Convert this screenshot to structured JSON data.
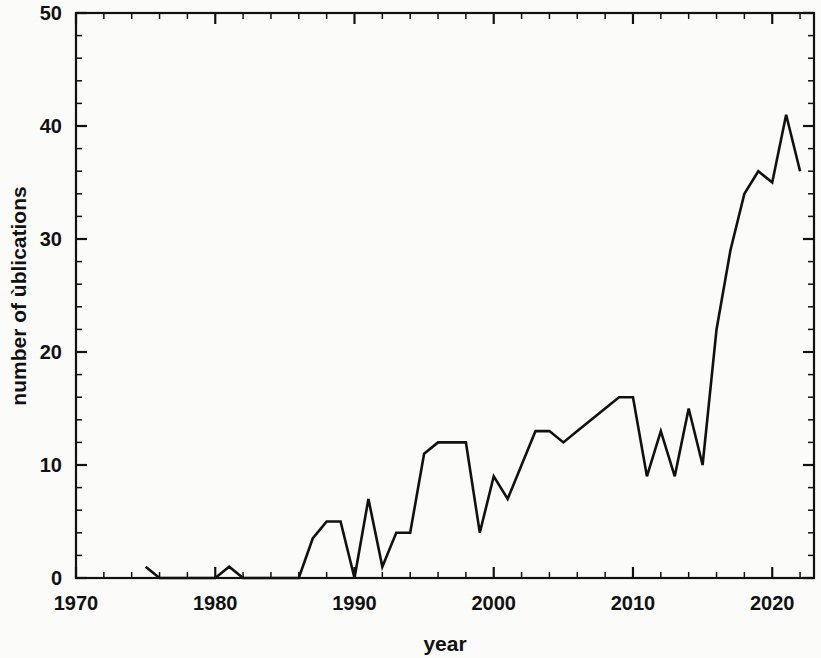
{
  "chart_data": {
    "type": "line",
    "title": "",
    "xlabel": "year",
    "ylabel": "number of ùblications",
    "xlim": [
      1970,
      2023
    ],
    "ylim": [
      0,
      50
    ],
    "xticks": [
      1970,
      1980,
      1990,
      2000,
      2010,
      2020
    ],
    "xtick_labels": [
      "1970",
      "1980",
      "1990",
      "2000",
      "2010",
      "2020"
    ],
    "yticks": [
      0,
      10,
      20,
      30,
      40,
      50
    ],
    "ytick_labels": [
      "0",
      "10",
      "20",
      "30",
      "40",
      "50"
    ],
    "x_minor_tick_interval": 2,
    "y_minor_tick_interval": 2,
    "grid": false,
    "legend": false,
    "line_color": "#111111",
    "background_color": "#fbfbfa",
    "x": [
      1975,
      1976,
      1977,
      1978,
      1979,
      1980,
      1981,
      1982,
      1983,
      1984,
      1985,
      1986,
      1987,
      1988,
      1989,
      1990,
      1991,
      1992,
      1993,
      1994,
      1995,
      1996,
      1997,
      1998,
      1999,
      2000,
      2001,
      2002,
      2003,
      2004,
      2005,
      2006,
      2007,
      2008,
      2009,
      2010,
      2011,
      2012,
      2013,
      2014,
      2015,
      2016,
      2017,
      2018,
      2019,
      2020,
      2021,
      2022
    ],
    "values": [
      1,
      0,
      0,
      0,
      0,
      0,
      1,
      0,
      0,
      0,
      0,
      0,
      3.5,
      5,
      5,
      0,
      7,
      1,
      4,
      4,
      11,
      12,
      12,
      12,
      4,
      9,
      7,
      10,
      13,
      13,
      12,
      13,
      14,
      15,
      16,
      16,
      9,
      13,
      9,
      15,
      10,
      22,
      29,
      34,
      36,
      35,
      41,
      36
    ],
    "series": [
      {
        "name": "number of publications",
        "values": [
          1,
          0,
          0,
          0,
          0,
          0,
          1,
          0,
          0,
          0,
          0,
          0,
          3.5,
          5,
          5,
          0,
          7,
          1,
          4,
          4,
          11,
          12,
          12,
          12,
          4,
          9,
          7,
          10,
          13,
          13,
          12,
          13,
          14,
          15,
          16,
          16,
          9,
          13,
          9,
          15,
          10,
          22,
          29,
          34,
          36,
          35,
          41,
          36
        ]
      }
    ],
    "annotations": []
  }
}
